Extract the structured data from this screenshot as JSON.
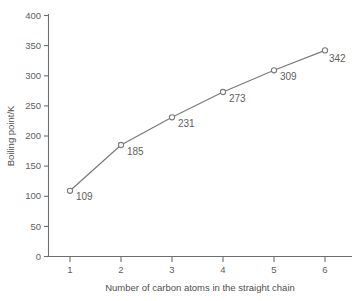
{
  "chart_data": {
    "type": "line",
    "title": "",
    "xlabel": "Number of carbon atoms in the straight chain",
    "ylabel": "Boiling point/K",
    "x": [
      1,
      2,
      3,
      4,
      5,
      6
    ],
    "values": [
      109,
      185,
      231,
      273,
      309,
      342
    ],
    "point_labels": [
      "109",
      "185",
      "231",
      "273",
      "309",
      "342"
    ],
    "xtick_labels": [
      "1",
      "2",
      "3",
      "4",
      "5",
      "6"
    ],
    "ytick_labels": [
      "0",
      "50",
      "100",
      "150",
      "200",
      "250",
      "300",
      "350",
      "400"
    ],
    "ytick_values": [
      0,
      50,
      100,
      150,
      200,
      250,
      300,
      350,
      400
    ],
    "xlim": [
      0.6,
      6.45
    ],
    "ylim": [
      0,
      400
    ],
    "grid": false,
    "legend": "none",
    "marker": "open-circle",
    "line_color": "#7a7a7a",
    "marker_fill": "#ffffff",
    "text_color": "#5e5e5e",
    "background_color": "#ffffff"
  }
}
